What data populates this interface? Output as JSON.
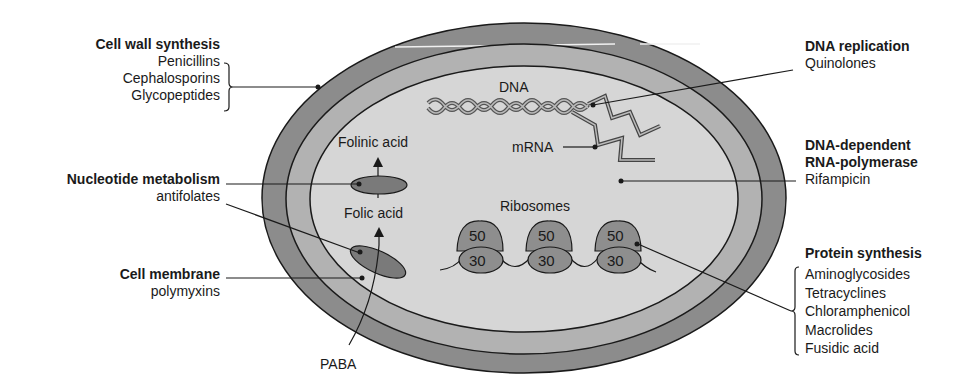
{
  "colors": {
    "outer_wall": "#8c8c8c",
    "middle_layer": "#b2b2b2",
    "cytoplasm": "#d6d6d6",
    "organelle": "#7a7a7a",
    "ribosome": "#8e8e8e",
    "line": "#1a1a1a"
  },
  "left_labels": {
    "cell_wall": {
      "title": "Cell wall synthesis",
      "drugs": [
        "Penicillins",
        "Cephalosporins",
        "Glycopeptides"
      ]
    },
    "nucleotide": {
      "title": "Nucleotide metabolism",
      "drugs": [
        "antifolates"
      ]
    },
    "membrane": {
      "title": "Cell membrane",
      "drugs": [
        "polymyxins"
      ]
    }
  },
  "right_labels": {
    "dna_replication": {
      "title": "DNA replication",
      "drugs": [
        "Quinolones"
      ]
    },
    "rna_polymerase": {
      "title_line1": "DNA-dependent",
      "title_line2": "RNA-polymerase",
      "drugs": [
        "Rifampicin"
      ]
    },
    "protein": {
      "title": "Protein synthesis",
      "drugs": [
        "Aminoglycosides",
        "Tetracyclines",
        "Chloramphenicol",
        "Macrolides",
        "Fusidic acid"
      ]
    }
  },
  "inner_labels": {
    "dna": "DNA",
    "mrna": "mRNA",
    "folinic": "Folinic acid",
    "folic": "Folic acid",
    "ribosomes": "Ribosomes",
    "paba": "PABA"
  },
  "ribosomes": [
    {
      "large": "50",
      "small": "30"
    },
    {
      "large": "50",
      "small": "30"
    },
    {
      "large": "50",
      "small": "30"
    }
  ]
}
